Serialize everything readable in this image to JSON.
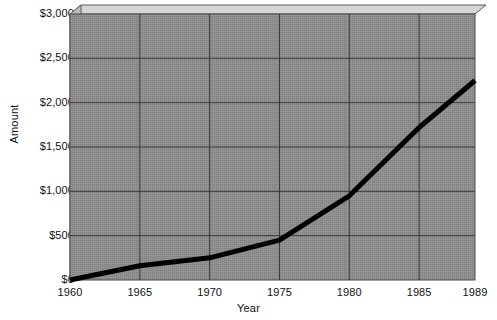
{
  "chart_data": {
    "type": "line",
    "title": "",
    "xlabel": "Year",
    "ylabel": "Amount",
    "xlim": [
      1960,
      1989
    ],
    "ylim": [
      0,
      3000
    ],
    "x_ticks": [
      "1960",
      "1965",
      "1970",
      "1975",
      "1980",
      "1985",
      "1989"
    ],
    "x_tick_values": [
      1960,
      1965,
      1970,
      1975,
      1980,
      1985,
      1989
    ],
    "y_ticks": [
      "$0",
      "$500",
      "$1,000",
      "$1,500",
      "$2,000",
      "$2,500",
      "$3,000"
    ],
    "y_tick_values": [
      0,
      500,
      1000,
      1500,
      2000,
      2500,
      3000
    ],
    "grid": true,
    "legend": "none",
    "series": [
      {
        "name": "Amount",
        "x": [
          1960,
          1965,
          1970,
          1975,
          1980,
          1985,
          1989
        ],
        "values": [
          0,
          160,
          250,
          450,
          950,
          1720,
          2250
        ]
      }
    ],
    "colors": {
      "line": "#000000",
      "plot_background": "#8a8a8a",
      "bevel_light": "#d0d0d0",
      "bevel_mid": "#b4b4b4",
      "gridline": "#3a3a3a",
      "page_background": "#ffffff",
      "text": "#111111"
    }
  }
}
